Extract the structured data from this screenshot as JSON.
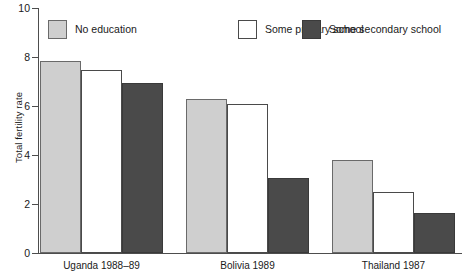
{
  "chart_data": {
    "type": "bar",
    "title": "",
    "xlabel": "",
    "ylabel": "Total fertility rate",
    "ylim": [
      0,
      10
    ],
    "yticks": [
      "0",
      "2",
      "4",
      "6",
      "8",
      "10"
    ],
    "grid": false,
    "legend_position": "top",
    "categories": [
      "Uganda 1988–89",
      "Bolivia 1989",
      "Thailand 1987"
    ],
    "series": [
      {
        "name": "No education",
        "color": "#cfcfcf",
        "values": [
          7.85,
          6.3,
          3.8
        ]
      },
      {
        "name": "Some primary school",
        "color": "#ffffff",
        "values": [
          7.45,
          6.1,
          2.48
        ]
      },
      {
        "name": "Some secondary school",
        "color": "#4a4a4a",
        "values": [
          6.95,
          3.05,
          1.65
        ]
      }
    ]
  },
  "axis": {
    "y_title": "Total fertility rate",
    "y_ticks": [
      {
        "label": "10",
        "value": 10
      },
      {
        "label": "8",
        "value": 8
      },
      {
        "label": "6",
        "value": 6
      },
      {
        "label": "4",
        "value": 4
      },
      {
        "label": "2",
        "value": 2
      },
      {
        "label": "0",
        "value": 0
      }
    ],
    "x_labels": [
      "Uganda 1988–89",
      "Bolivia 1989",
      "Thailand 1987"
    ]
  },
  "legend": {
    "items": [
      {
        "label": "No education",
        "swatch": "light"
      },
      {
        "label": "Some primary school",
        "swatch": "white"
      },
      {
        "label": "Some secondary school",
        "swatch": "dark"
      }
    ]
  },
  "colors": {
    "no_education": "#cfcfcf",
    "some_primary_school": "#ffffff",
    "some_secondary_school": "#4a4a4a",
    "axis": "#4d4d4d",
    "text": "#1a1a1a"
  }
}
